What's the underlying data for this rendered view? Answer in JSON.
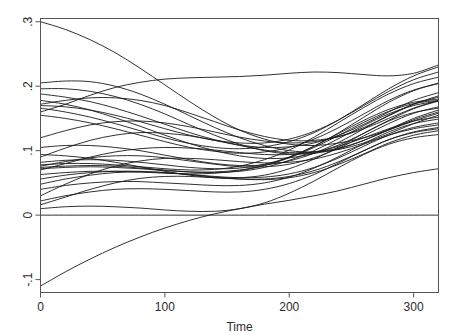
{
  "chart_data": {
    "type": "line",
    "title": "",
    "subtitle": "",
    "xlabel": "Time",
    "ylabel": "",
    "xlim": [
      0,
      320
    ],
    "ylim": [
      -0.12,
      0.305
    ],
    "grid": false,
    "legend": null,
    "xticks": [
      0,
      100,
      200,
      300
    ],
    "xticklabels": [
      "0",
      "100",
      "200",
      "300"
    ],
    "yticks": [
      -0.1,
      0,
      0.1,
      0.2,
      0.3
    ],
    "yticklabels": [
      "-.1",
      "0",
      ".1",
      ".2",
      ".3"
    ],
    "x": [
      0,
      20,
      40,
      60,
      80,
      100,
      120,
      140,
      160,
      180,
      200,
      220,
      240,
      260,
      280,
      300,
      320
    ],
    "series": [
      {
        "name": "curve-01",
        "values": [
          0.3,
          0.288,
          0.272,
          0.252,
          0.228,
          0.202,
          0.176,
          0.152,
          0.132,
          0.118,
          0.11,
          0.108,
          0.112,
          0.12,
          0.132,
          0.146,
          0.158
        ]
      },
      {
        "name": "curve-02",
        "values": [
          0.205,
          0.208,
          0.207,
          0.2,
          0.188,
          0.172,
          0.154,
          0.136,
          0.12,
          0.108,
          0.1,
          0.098,
          0.102,
          0.112,
          0.126,
          0.142,
          0.155
        ]
      },
      {
        "name": "curve-03",
        "values": [
          0.196,
          0.196,
          0.192,
          0.184,
          0.172,
          0.157,
          0.14,
          0.124,
          0.11,
          0.1,
          0.095,
          0.096,
          0.103,
          0.116,
          0.133,
          0.15,
          0.163
        ]
      },
      {
        "name": "curve-04",
        "values": [
          0.188,
          0.183,
          0.176,
          0.166,
          0.154,
          0.141,
          0.128,
          0.117,
          0.109,
          0.105,
          0.106,
          0.112,
          0.124,
          0.141,
          0.16,
          0.178,
          0.19
        ]
      },
      {
        "name": "curve-05",
        "values": [
          0.172,
          0.178,
          0.182,
          0.182,
          0.178,
          0.17,
          0.158,
          0.145,
          0.132,
          0.122,
          0.116,
          0.116,
          0.122,
          0.134,
          0.15,
          0.166,
          0.178
        ]
      },
      {
        "name": "curve-06",
        "values": [
          0.17,
          0.168,
          0.163,
          0.155,
          0.145,
          0.134,
          0.124,
          0.116,
          0.112,
          0.112,
          0.118,
          0.13,
          0.148,
          0.17,
          0.192,
          0.21,
          0.222
        ]
      },
      {
        "name": "curve-07",
        "values": [
          0.166,
          0.16,
          0.152,
          0.142,
          0.131,
          0.12,
          0.111,
          0.105,
          0.103,
          0.106,
          0.114,
          0.128,
          0.148,
          0.172,
          0.196,
          0.216,
          0.23
        ]
      },
      {
        "name": "curve-08",
        "values": [
          0.16,
          0.172,
          0.186,
          0.198,
          0.206,
          0.211,
          0.213,
          0.214,
          0.215,
          0.217,
          0.22,
          0.222,
          0.221,
          0.218,
          0.216,
          0.22,
          0.233
        ]
      },
      {
        "name": "curve-09",
        "values": [
          0.12,
          0.131,
          0.14,
          0.145,
          0.146,
          0.143,
          0.137,
          0.129,
          0.121,
          0.115,
          0.112,
          0.114,
          0.122,
          0.136,
          0.154,
          0.172,
          0.185
        ]
      },
      {
        "name": "curve-10",
        "values": [
          0.105,
          0.108,
          0.108,
          0.105,
          0.1,
          0.093,
          0.086,
          0.08,
          0.077,
          0.078,
          0.084,
          0.096,
          0.113,
          0.134,
          0.155,
          0.172,
          0.183
        ]
      },
      {
        "name": "curve-11",
        "values": [
          0.09,
          0.104,
          0.116,
          0.124,
          0.128,
          0.127,
          0.123,
          0.116,
          0.108,
          0.101,
          0.097,
          0.098,
          0.104,
          0.116,
          0.132,
          0.148,
          0.16
        ]
      },
      {
        "name": "curve-12",
        "values": [
          0.082,
          0.085,
          0.086,
          0.085,
          0.082,
          0.078,
          0.074,
          0.072,
          0.073,
          0.079,
          0.09,
          0.107,
          0.128,
          0.152,
          0.175,
          0.193,
          0.205
        ]
      },
      {
        "name": "curve-13",
        "values": [
          0.078,
          0.08,
          0.08,
          0.078,
          0.075,
          0.072,
          0.07,
          0.071,
          0.076,
          0.086,
          0.101,
          0.121,
          0.144,
          0.167,
          0.188,
          0.204,
          0.214
        ]
      },
      {
        "name": "curve-14",
        "values": [
          0.076,
          0.083,
          0.089,
          0.092,
          0.092,
          0.089,
          0.084,
          0.079,
          0.075,
          0.075,
          0.079,
          0.089,
          0.104,
          0.123,
          0.142,
          0.158,
          0.168
        ]
      },
      {
        "name": "curve-15",
        "values": [
          0.074,
          0.076,
          0.077,
          0.076,
          0.073,
          0.07,
          0.067,
          0.066,
          0.068,
          0.074,
          0.085,
          0.1,
          0.119,
          0.139,
          0.157,
          0.17,
          0.177
        ]
      },
      {
        "name": "curve-16",
        "values": [
          0.072,
          0.074,
          0.075,
          0.074,
          0.072,
          0.069,
          0.067,
          0.067,
          0.07,
          0.077,
          0.089,
          0.105,
          0.124,
          0.144,
          0.161,
          0.173,
          0.178
        ]
      },
      {
        "name": "curve-17",
        "values": [
          0.07,
          0.08,
          0.09,
          0.098,
          0.103,
          0.105,
          0.104,
          0.101,
          0.097,
          0.094,
          0.094,
          0.098,
          0.107,
          0.12,
          0.134,
          0.146,
          0.152
        ]
      },
      {
        "name": "curve-18",
        "values": [
          0.063,
          0.066,
          0.068,
          0.068,
          0.067,
          0.065,
          0.064,
          0.065,
          0.069,
          0.077,
          0.09,
          0.107,
          0.127,
          0.147,
          0.164,
          0.175,
          0.18
        ]
      },
      {
        "name": "curve-19",
        "values": [
          0.056,
          0.062,
          0.066,
          0.068,
          0.068,
          0.066,
          0.063,
          0.06,
          0.058,
          0.059,
          0.064,
          0.074,
          0.089,
          0.107,
          0.124,
          0.136,
          0.143
        ]
      },
      {
        "name": "curve-20",
        "values": [
          0.048,
          0.056,
          0.062,
          0.066,
          0.067,
          0.066,
          0.063,
          0.059,
          0.056,
          0.055,
          0.058,
          0.066,
          0.079,
          0.095,
          0.112,
          0.124,
          0.131
        ]
      },
      {
        "name": "curve-21",
        "values": [
          0.04,
          0.046,
          0.05,
          0.052,
          0.052,
          0.05,
          0.048,
          0.046,
          0.046,
          0.05,
          0.059,
          0.073,
          0.091,
          0.111,
          0.129,
          0.142,
          0.149
        ]
      },
      {
        "name": "curve-22",
        "values": [
          0.03,
          0.048,
          0.064,
          0.076,
          0.084,
          0.088,
          0.088,
          0.086,
          0.083,
          0.081,
          0.082,
          0.087,
          0.097,
          0.11,
          0.124,
          0.134,
          0.14
        ]
      },
      {
        "name": "curve-23",
        "values": [
          0.022,
          0.03,
          0.036,
          0.04,
          0.041,
          0.04,
          0.038,
          0.036,
          0.036,
          0.04,
          0.049,
          0.063,
          0.081,
          0.1,
          0.117,
          0.128,
          0.134
        ]
      },
      {
        "name": "curve-24",
        "values": [
          0.016,
          0.028,
          0.04,
          0.05,
          0.057,
          0.06,
          0.06,
          0.058,
          0.056,
          0.056,
          0.06,
          0.069,
          0.083,
          0.1,
          0.117,
          0.129,
          0.136
        ]
      },
      {
        "name": "curve-25",
        "values": [
          0.01,
          0.013,
          0.014,
          0.013,
          0.011,
          0.008,
          0.006,
          0.006,
          0.01,
          0.019,
          0.034,
          0.053,
          0.074,
          0.094,
          0.11,
          0.12,
          0.125
        ]
      },
      {
        "name": "curve-26",
        "values": [
          0.0,
          0.0,
          0.0,
          0.0,
          0.0,
          0.0,
          0.0,
          0.0,
          0.0,
          0.0,
          0.0,
          0.0,
          0.0,
          0.0,
          0.0,
          0.0,
          0.0
        ]
      },
      {
        "name": "curve-27",
        "values": [
          -0.11,
          -0.088,
          -0.068,
          -0.05,
          -0.034,
          -0.02,
          -0.008,
          0.002,
          0.01,
          0.017,
          0.023,
          0.03,
          0.038,
          0.048,
          0.058,
          0.066,
          0.072
        ]
      },
      {
        "name": "curve-28",
        "values": [
          0.155,
          0.15,
          0.143,
          0.134,
          0.124,
          0.114,
          0.105,
          0.099,
          0.096,
          0.098,
          0.105,
          0.118,
          0.136,
          0.157,
          0.178,
          0.194,
          0.204
        ]
      },
      {
        "name": "curve-29",
        "values": [
          0.178,
          0.172,
          0.163,
          0.151,
          0.138,
          0.124,
          0.111,
          0.1,
          0.092,
          0.088,
          0.089,
          0.096,
          0.109,
          0.127,
          0.147,
          0.165,
          0.177
        ]
      },
      {
        "name": "curve-30",
        "values": [
          0.094,
          0.092,
          0.088,
          0.082,
          0.075,
          0.068,
          0.062,
          0.058,
          0.058,
          0.062,
          0.072,
          0.087,
          0.106,
          0.127,
          0.146,
          0.159,
          0.166
        ]
      }
    ],
    "colors": {
      "line": "#1a1a1a",
      "axis": "#555555",
      "text": "#2b2b2b",
      "background": "#ffffff"
    }
  },
  "figure": {
    "xaxis_title": "Time",
    "tick_labels_x": [
      "0",
      "100",
      "200",
      "300"
    ],
    "tick_labels_y": [
      "-.1",
      "0",
      ".1",
      ".2",
      ".3"
    ]
  }
}
